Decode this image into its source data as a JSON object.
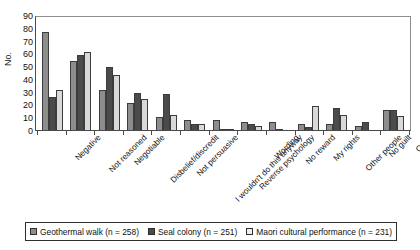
{
  "chart_data": {
    "type": "bar",
    "title": "",
    "xlabel": "",
    "ylabel": "No.",
    "ylim": [
      0,
      90
    ],
    "ytick_step": 10,
    "yticks": [
      90,
      80,
      70,
      60,
      50,
      40,
      30,
      20,
      10,
      0
    ],
    "grid": false,
    "legend_position": "bottom",
    "categories": [
      "Negative",
      "Not reasoned",
      "Negotiable",
      "Disbelief/discredit",
      "Not persuasive",
      "I wouldn't do this anyway",
      "Reverse psychology",
      "Wording",
      "No reward",
      "My rights",
      "Other people",
      "No guilt",
      "Other"
    ],
    "series": [
      {
        "name": "Geothermal walk (n = 258)",
        "color": "#8d8d8d",
        "values": [
          77,
          54,
          31,
          21,
          10,
          8,
          8,
          6,
          6,
          5,
          5,
          3,
          16
        ]
      },
      {
        "name": "Seal colony (n = 251)",
        "color": "#4b4b4b",
        "values": [
          26,
          59,
          49,
          29,
          28,
          5,
          1,
          5,
          1,
          2,
          17,
          6,
          16
        ]
      },
      {
        "name": "Maori cultural performance (n = 231)",
        "color": "#d9d9d9",
        "values": [
          31,
          61,
          43,
          24,
          12,
          5,
          0.5,
          3,
          0,
          19,
          12,
          0,
          11
        ]
      }
    ]
  },
  "legend": {
    "items": [
      {
        "label": "Geothermal walk (n = 258)",
        "swatch": "series-0-swatch"
      },
      {
        "label": "Seal colony (n = 251)",
        "swatch": "series-1-swatch"
      },
      {
        "label": "Maori cultural performance (n = 231)",
        "swatch": "series-2-swatch"
      }
    ]
  }
}
